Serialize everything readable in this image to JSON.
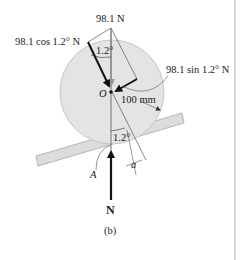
{
  "figure": {
    "caption": "(b)",
    "labels": {
      "weight": "98.1 N",
      "normal_component": "98.1 cos 1.2° N",
      "tangential_component": "98.1 sin 1.2° N",
      "angle_top": "1.2°",
      "angle_bottom": "1.2°",
      "center": "O",
      "radius": "100 mm",
      "contact_point": "A",
      "offset": "a",
      "normal_force": "N"
    },
    "colors": {
      "wheel_fill": "#e4e4e4",
      "wheel_stroke": "#bdbdbd",
      "plane_fill": "#dcdcdc",
      "plane_stroke": "#a8a8a8",
      "arrow": "#111111",
      "thin_line": "#555555",
      "page_rule": "#b0b0b0"
    }
  }
}
